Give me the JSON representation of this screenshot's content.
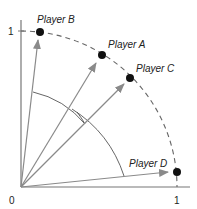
{
  "diagram": {
    "axes": {
      "x_ticks": [
        {
          "label": "0",
          "value": 0
        },
        {
          "label": "1",
          "value": 1
        }
      ],
      "y_ticks": [
        {
          "label": "1",
          "value": 1
        }
      ]
    },
    "arc": {
      "style": "dashed",
      "radius": 1
    },
    "players": [
      {
        "name": "Player B",
        "x": 0.12,
        "y": 0.99
      },
      {
        "name": "Player A",
        "x": 0.52,
        "y": 0.85
      },
      {
        "name": "Player C",
        "x": 0.7,
        "y": 0.7
      },
      {
        "name": "Player D",
        "x": 1.0,
        "y": 0.1
      }
    ],
    "colors": {
      "axis": "#777777",
      "arrow": "#8a8a8a",
      "dot": "#111111",
      "arc": "#666666"
    }
  }
}
